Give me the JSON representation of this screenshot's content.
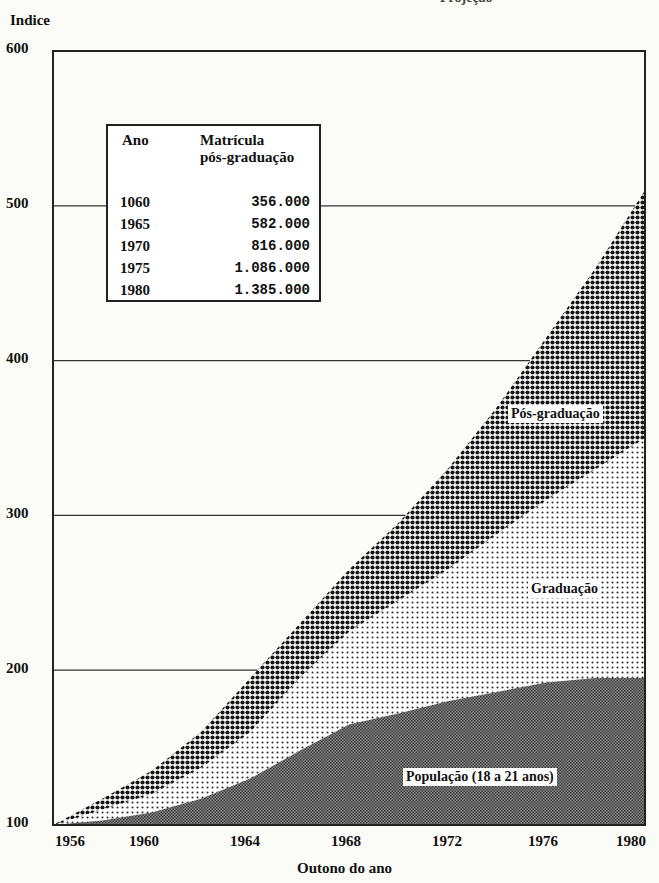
{
  "chart_data": {
    "type": "area",
    "stacked": true,
    "title": "",
    "xlabel": "Outono do ano",
    "ylabel": "Indice",
    "xlim": [
      1956,
      1980
    ],
    "ylim": [
      100,
      600
    ],
    "grid": "horizontal",
    "x_ticks": [
      "1956",
      "1960",
      "1964",
      "1968",
      "1972",
      "1976",
      "1980"
    ],
    "y_ticks": [
      "100",
      "200",
      "300",
      "400",
      "500",
      "600"
    ],
    "x": [
      1956,
      1958,
      1960,
      1962,
      1964,
      1966,
      1968,
      1970,
      1972,
      1974,
      1976,
      1978,
      1980
    ],
    "series": [
      {
        "name": "População (18 a 21 anos)",
        "pattern": "fine-dark-gray",
        "values": [
          100,
          103,
          108,
          117,
          130,
          148,
          165,
          172,
          180,
          186,
          192,
          195,
          195
        ]
      },
      {
        "name": "Graduação",
        "pattern": "light-dots",
        "values": [
          100,
          110,
          120,
          137,
          160,
          195,
          225,
          245,
          265,
          288,
          310,
          330,
          350
        ]
      },
      {
        "name": "Pós-graduação",
        "pattern": "coarse-black-dots",
        "values": [
          100,
          117,
          135,
          160,
          195,
          230,
          265,
          295,
          330,
          370,
          415,
          460,
          510
        ]
      }
    ],
    "legend": "inline labels on areas",
    "inset_table": {
      "headers": [
        "Ano",
        "Matrícula pós-graduação"
      ],
      "rows": [
        [
          "1060",
          "356.000"
        ],
        [
          "1965",
          "582.000"
        ],
        [
          "1970",
          "816.000"
        ],
        [
          "1975",
          "1.086.000"
        ],
        [
          "1980",
          "1.385.000"
        ]
      ]
    }
  },
  "labels": {
    "y_title": "Indice",
    "x_title": "Outono do ano",
    "y_ticks": [
      "600",
      "500",
      "400",
      "300",
      "200",
      "100"
    ],
    "x_ticks": [
      "1956",
      "1960",
      "1964",
      "1968",
      "1972",
      "1976",
      "1980"
    ],
    "series_pos": "Pós-graduação",
    "series_grad": "Graduação",
    "series_pop": "População (18 a 21 anos)",
    "table_h_ano": "Ano",
    "table_h_mat_1": "Matrícula",
    "table_h_mat_2": "pós-graduação",
    "top_fragment": "Projeção"
  },
  "table_rows": [
    {
      "ano": "1060",
      "val": "356.000"
    },
    {
      "ano": "1965",
      "val": "582.000"
    },
    {
      "ano": "1970",
      "val": "816.000"
    },
    {
      "ano": "1975",
      "val": "1.086.000"
    },
    {
      "ano": "1980",
      "val": "1.385.000"
    }
  ],
  "colors": {
    "background": "#fbfbf8",
    "axis": "#222222",
    "pos_fill": "#1a1a1a",
    "grad_fill": "#444444",
    "pop_fill": "#555555"
  }
}
